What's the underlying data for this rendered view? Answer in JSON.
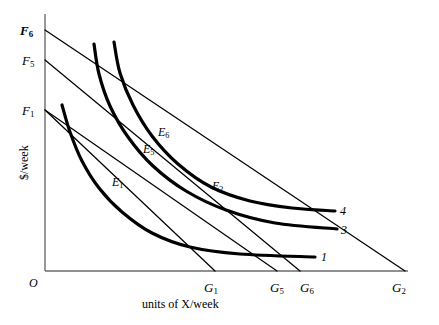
{
  "figure": {
    "axes": {
      "y_title": "$/week",
      "x_title": "units of X/week",
      "origin_label": "O"
    },
    "y_intercepts": [
      {
        "id": "F6",
        "base": "F",
        "sub": "6",
        "bold": true,
        "x": 20,
        "y": 24
      },
      {
        "id": "F5",
        "base": "F",
        "sub": "5",
        "bold": false,
        "x": 22,
        "y": 54
      },
      {
        "id": "F1",
        "base": "F",
        "sub": "1",
        "bold": false,
        "x": 22,
        "y": 104
      }
    ],
    "x_intercepts": [
      {
        "id": "G1",
        "base": "G",
        "sub": "1",
        "x": 204,
        "y": 281
      },
      {
        "id": "G5",
        "base": "G",
        "sub": "5",
        "x": 270,
        "y": 281
      },
      {
        "id": "G6",
        "base": "G",
        "sub": "6",
        "x": 300,
        "y": 281
      },
      {
        "id": "G2",
        "base": "G",
        "sub": "2",
        "x": 392,
        "y": 281
      }
    ],
    "equilibrium_points": [
      {
        "id": "E6",
        "base": "E",
        "sub": "6",
        "x": 158,
        "y": 126
      },
      {
        "id": "E5",
        "base": "E",
        "sub": "5",
        "x": 143,
        "y": 143
      },
      {
        "id": "E1",
        "base": "E",
        "sub": "1",
        "x": 112,
        "y": 176
      },
      {
        "id": "E2",
        "base": "E",
        "sub": "2",
        "x": 212,
        "y": 180
      }
    ],
    "curve_labels": [
      {
        "id": "curve-4",
        "text": "4",
        "x": 340,
        "y": 205
      },
      {
        "id": "curve-3",
        "text": "3",
        "x": 341,
        "y": 224
      },
      {
        "id": "curve-1",
        "text": "1",
        "x": 321,
        "y": 251
      }
    ]
  },
  "chart_data": {
    "type": "line",
    "title": "",
    "xlabel": "units of X/week",
    "ylabel": "$/week",
    "grid": false,
    "legend": "none",
    "axis_pixel_frame": {
      "origin": [
        45,
        271
      ],
      "y_top": [
        45,
        14
      ],
      "x_right": [
        408,
        271
      ]
    },
    "budget_lines": [
      {
        "name": "F6-G2",
        "from_label": "F6",
        "to_label": "G2",
        "from": [
          45,
          30
        ],
        "to": [
          405,
          271
        ]
      },
      {
        "name": "F5-G6",
        "from_label": "F5",
        "to_label": "G6",
        "from": [
          45,
          60
        ],
        "to": [
          300,
          271
        ]
      },
      {
        "name": "F1-G1",
        "from_label": "F1",
        "to_label": "G1",
        "from": [
          45,
          110
        ],
        "to": [
          215,
          271
        ]
      },
      {
        "name": "F1-G5",
        "from_label": "F1",
        "to_label": "G5",
        "from": [
          45,
          110
        ],
        "to": [
          277,
          271
        ]
      }
    ],
    "indifference_curves": [
      {
        "name": "1",
        "label": "1",
        "points": [
          [
            62,
            105
          ],
          [
            70,
            132
          ],
          [
            82,
            161
          ],
          [
            99,
            188
          ],
          [
            122,
            212
          ],
          [
            152,
            233
          ],
          [
            190,
            247
          ],
          [
            240,
            254
          ],
          [
            315,
            257
          ]
        ]
      },
      {
        "name": "3",
        "label": "3",
        "points": [
          [
            94,
            44
          ],
          [
            99,
            74
          ],
          [
            110,
            106
          ],
          [
            128,
            137
          ],
          [
            153,
            166
          ],
          [
            186,
            191
          ],
          [
            226,
            210
          ],
          [
            275,
            223
          ],
          [
            337,
            229
          ]
        ]
      },
      {
        "name": "4",
        "label": "4",
        "points": [
          [
            114,
            42
          ],
          [
            120,
            73
          ],
          [
            133,
            105
          ],
          [
            152,
            136
          ],
          [
            178,
            164
          ],
          [
            211,
            187
          ],
          [
            250,
            201
          ],
          [
            292,
            208
          ],
          [
            335,
            211
          ]
        ]
      }
    ]
  }
}
